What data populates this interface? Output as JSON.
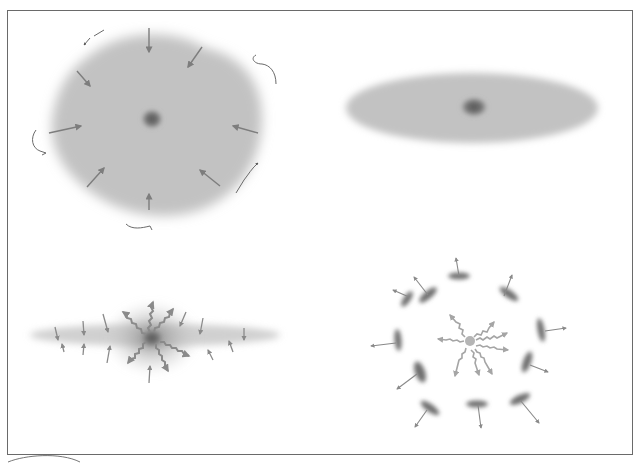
{
  "figure": {
    "colors": {
      "background": "#ffffff",
      "frame": "#6a6a6a",
      "cloud": "#bdbdbd",
      "core": "#707070",
      "arrow": "#7d7d7d",
      "clump": "#6e6e6e"
    },
    "panels": [
      {
        "id": "top-left",
        "label": "collapsing spherical cloud",
        "center": [
          152,
          118
        ],
        "inward_arrows": 8,
        "rotation_marks": 6
      },
      {
        "id": "top-right",
        "label": "flattened rotating disk",
        "center": [
          472,
          108
        ]
      },
      {
        "id": "bottom-left",
        "label": "disk with central burst and outflow",
        "center": [
          152,
          340
        ],
        "outflow_arrows": 8,
        "inflow_arrows": 14
      },
      {
        "id": "bottom-right",
        "label": "expanding ring of clumps",
        "center": [
          470,
          341
        ],
        "wavy_arrows": 8,
        "clumps": 11
      }
    ]
  }
}
